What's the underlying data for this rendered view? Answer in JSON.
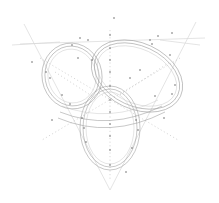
{
  "diagram": {
    "title": "",
    "colors": {
      "background": "#ffffff",
      "ring_stroke": "#9a9a9a",
      "guide_stroke": "#d9d9d9",
      "point": "#6a6a6a"
    },
    "triangle": [
      [
        18,
        45
      ],
      [
        205,
        38
      ],
      [
        110,
        188
      ]
    ],
    "rings": [
      {
        "name": "top-left-ring",
        "cx": 72,
        "cy": 76,
        "rx": 30,
        "ry": 33,
        "rotate": -10
      },
      {
        "name": "top-right-ring",
        "cx": 137,
        "cy": 76,
        "rx": 48,
        "ry": 33,
        "rotate": 25
      },
      {
        "name": "bottom-ring",
        "cx": 110,
        "cy": 128,
        "rx": 30,
        "ry": 42,
        "rotate": 0
      }
    ],
    "labels": []
  }
}
